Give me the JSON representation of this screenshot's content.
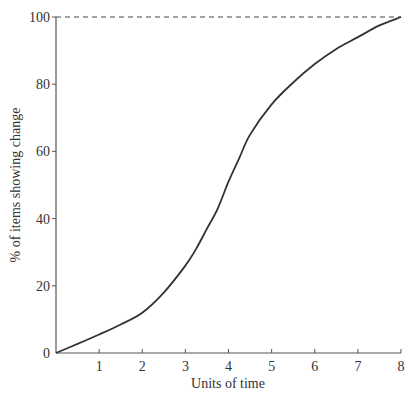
{
  "chart_data": {
    "type": "line",
    "title": "",
    "xlabel": "Units of time",
    "ylabel": "% of items showing change",
    "xlim": [
      0,
      8
    ],
    "ylim": [
      0,
      100
    ],
    "x_ticks": [
      1,
      2,
      3,
      4,
      5,
      6,
      7,
      8
    ],
    "y_ticks": [
      0,
      20,
      40,
      60,
      80,
      100
    ],
    "grid": false,
    "legend": null,
    "series": [
      {
        "name": "S-curve of change",
        "x": [
          0,
          0.5,
          1,
          1.5,
          2,
          2.5,
          3,
          3.25,
          3.5,
          3.75,
          4,
          4.25,
          4.5,
          5,
          5.5,
          6,
          6.5,
          7,
          7.5,
          8
        ],
        "values": [
          0,
          2.7,
          5.5,
          8.5,
          12,
          18,
          26,
          31,
          37,
          43,
          51,
          58,
          65,
          74,
          80.5,
          86,
          90.5,
          94,
          97.5,
          100
        ]
      }
    ],
    "annotations": [
      {
        "type": "dashed-horizontal-line",
        "y": 100,
        "x_from": 0,
        "x_to": 8
      }
    ],
    "colors": {
      "line": "#333333",
      "axis": "#555555",
      "background": "#ffffff"
    }
  }
}
